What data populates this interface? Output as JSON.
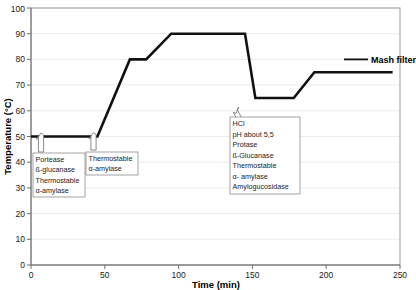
{
  "chart_data": {
    "type": "line",
    "title": "",
    "xlabel": "Time (min)",
    "ylabel": "Temperature (°C)",
    "xlim": [
      0,
      250
    ],
    "ylim": [
      0,
      100
    ],
    "xticks": [
      "0",
      "50",
      "100",
      "150",
      "200",
      "250"
    ],
    "yticks": [
      "0",
      "10",
      "20",
      "30",
      "40",
      "50",
      "60",
      "70",
      "80",
      "90",
      "100"
    ],
    "grid": "horizontal",
    "legend_position": "none",
    "series": [
      {
        "name": "Mashing temperature profile",
        "x": [
          0,
          45,
          67,
          78,
          95,
          145,
          152,
          178,
          192,
          245
        ],
        "y": [
          50,
          50,
          80,
          80,
          90,
          90,
          65,
          65,
          75,
          75
        ]
      }
    ],
    "annotations": [
      {
        "id": "annotation-box-1",
        "point_x": 2,
        "point_y": 50,
        "lines": [
          "Portease",
          "ß-glucanase",
          "Thermostable",
          "α-amylase"
        ]
      },
      {
        "id": "annotation-box-2",
        "point_x": 36,
        "point_y": 50,
        "lines": [
          "Thermostable",
          "α-amylase"
        ]
      },
      {
        "id": "annotation-box-3",
        "point_x": 151,
        "point_y": 65,
        "lines": [
          "HCl",
          "pH about 5,5",
          "Protase",
          "ß-Glucanase",
          "Thermostable",
          "α- amylase",
          "Amylogucosidase"
        ]
      }
    ],
    "callouts": [
      {
        "id": "mash-filter-callout",
        "label": "Mash filter",
        "point_x": 212,
        "point_y": 75
      }
    ],
    "colors": {
      "line": "#111111",
      "grid": "#e2e2e2",
      "frame": "#9a9a9a",
      "axis": "#6f6f6f",
      "text": "#1a1a1a",
      "box_border": "#8c8c8c"
    }
  }
}
